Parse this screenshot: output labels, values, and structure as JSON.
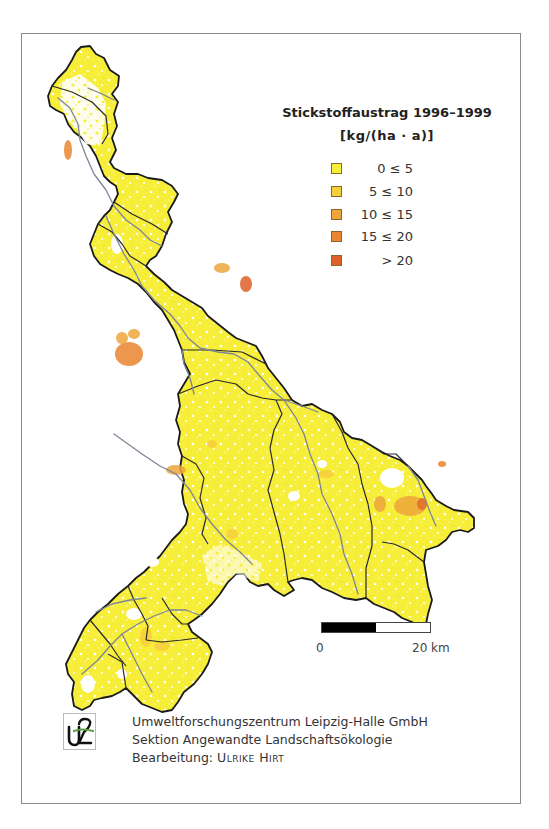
{
  "legend": {
    "title": "Stickstoffaustrag 1996–1999",
    "unit": "[kg/(ha · a)]",
    "classes": [
      {
        "label": "0 ≤ 5",
        "color": "#f7ee3a"
      },
      {
        "label": "5 ≤ 10",
        "color": "#f6cf3a"
      },
      {
        "label": "10 ≤ 15",
        "color": "#eea63a"
      },
      {
        "label": "15 ≤ 20",
        "color": "#ea8530"
      },
      {
        "label": "> 20",
        "color": "#e0602a"
      }
    ]
  },
  "scalebar": {
    "start_label": "0",
    "end_label": "20 km"
  },
  "credits": {
    "line1": "Umweltforschungszentrum Leipzig-Halle GmbH",
    "line2": "Sektion Angewandte Landschaftsökologie",
    "line3_prefix": "Bearbeitung: ",
    "line3_author": "Ulrike Hirt"
  },
  "logo": {
    "text": "UFZ"
  },
  "colors": {
    "base_fill": "#f7ee3a",
    "outline": "#1a1a1a",
    "river": "#8a8fa0",
    "frame": "#8a8a8a"
  }
}
